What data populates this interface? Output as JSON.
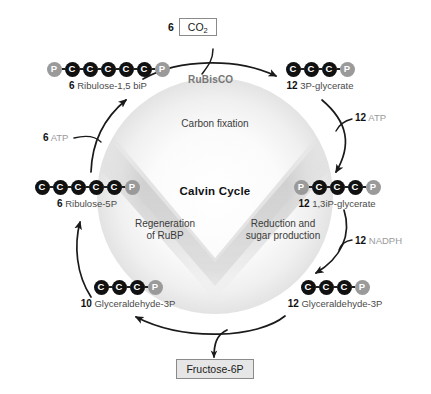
{
  "diagram": {
    "title": "Calvin Cycle",
    "center": {
      "cycle_title": "Calvin Cycle",
      "phase_top": "Carbon fixation",
      "phase_left_line1": "Regeneration",
      "phase_left_line2": "of RuBP",
      "phase_right_line1": "Reduction and",
      "phase_right_line2": "sugar production"
    },
    "inputs": {
      "co2_count": "6",
      "co2_label": "CO",
      "co2_subscript": "2"
    },
    "outputs": {
      "product_label": "Fructose-6P"
    },
    "enzymes": {
      "rubisco": "RuBisCO"
    },
    "cofactors": [
      {
        "name": "atp-left",
        "count": "6",
        "label": "ATP"
      },
      {
        "name": "atp-right",
        "count": "12",
        "label": "ATP"
      },
      {
        "name": "nadph-right",
        "count": "12",
        "label": "NADPH"
      }
    ],
    "molecules": [
      {
        "id": "ribulose-1-5-bip",
        "count": "6",
        "name": "Ribulose-1,5 biP",
        "nodes": [
          "P",
          "C",
          "C",
          "C",
          "C",
          "C",
          "P"
        ]
      },
      {
        "id": "3p-glycerate",
        "count": "12",
        "name": "3P-glycerate",
        "nodes": [
          "C",
          "C",
          "C",
          "P"
        ]
      },
      {
        "id": "1-3ip-glycerate",
        "count": "12",
        "name": "1,3iP-glycerate",
        "nodes": [
          "P",
          "C",
          "C",
          "C",
          "P"
        ]
      },
      {
        "id": "glyceraldehyde-3p-right",
        "count": "12",
        "name": "Glyceraldehyde-3P",
        "nodes": [
          "C",
          "C",
          "C",
          "P"
        ]
      },
      {
        "id": "glyceraldehyde-3p-left",
        "count": "10",
        "name": "Glyceraldehyde-3P",
        "nodes": [
          "C",
          "C",
          "C",
          "P"
        ]
      },
      {
        "id": "ribulose-5p",
        "count": "6",
        "name": "Ribulose-5P",
        "nodes": [
          "C",
          "C",
          "C",
          "C",
          "C",
          "P"
        ]
      }
    ],
    "colors": {
      "carbon_node": "#111111",
      "phosphate_node": "#9a9a9a",
      "arrow": "#1a1a1a",
      "cofactor_text": "#9a9a9a",
      "enzyme_text": "#777777",
      "box_fill": "#e6e6e6",
      "cycle_fill": "#d9d9d9"
    }
  }
}
